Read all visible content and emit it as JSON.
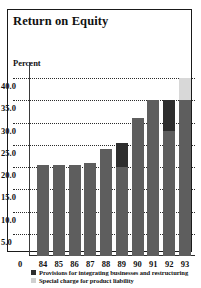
{
  "chart_data": {
    "type": "bar",
    "title": "Return on Equity",
    "ylabel": "Percent",
    "xlabel": "",
    "ylim": [
      0,
      40
    ],
    "ytick_labels": [
      "40.0",
      "35.0",
      "30.0",
      "25.0",
      "20.0",
      "15.0",
      "10.0",
      "5.0"
    ],
    "ytick_values": [
      40,
      35,
      30,
      25,
      20,
      15,
      10,
      5
    ],
    "zero_label": "0",
    "grid": true,
    "legend_position": "bottom",
    "categories": [
      "84",
      "85",
      "86",
      "87",
      "88",
      "89",
      "90",
      "91",
      "92",
      "93"
    ],
    "series": [
      {
        "name": "Return on equity",
        "key": "base",
        "color": "#5e5e5e",
        "values": [
          20.5,
          20.5,
          20.5,
          21.0,
          24.0,
          20.0,
          31.0,
          35.0,
          28.0,
          35.5
        ]
      },
      {
        "name": "Provisions for integrating businesses and restructuring",
        "key": "provisions",
        "color": "#2e2e2e",
        "values": [
          0,
          0,
          0,
          0,
          0,
          5.5,
          0,
          0,
          7.0,
          0
        ]
      },
      {
        "name": "Special charge for product liability",
        "key": "special",
        "color": "#d8d8d8",
        "values": [
          0,
          0,
          0,
          0,
          0,
          0,
          0,
          0,
          0,
          5.0
        ]
      }
    ],
    "totals": [
      20.5,
      20.5,
      20.5,
      21.0,
      24.0,
      25.5,
      31.0,
      35.0,
      35.0,
      40.5
    ],
    "legend": [
      {
        "label": "Provisions for integrating businesses and restructuring",
        "color": "#2e2e2e"
      },
      {
        "label": "Special charge for product liability",
        "color": "#d0d0d0"
      }
    ]
  }
}
